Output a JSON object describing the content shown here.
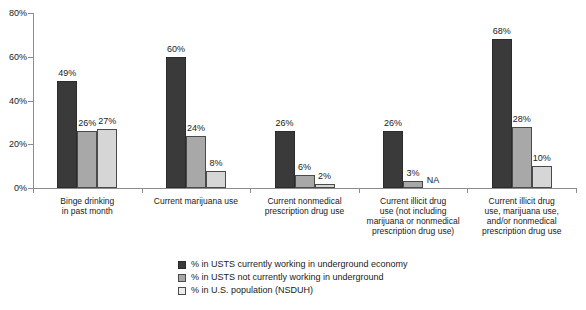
{
  "chart_data": {
    "type": "bar",
    "title": "",
    "xlabel": "",
    "ylabel": "",
    "ylim": [
      0,
      80
    ],
    "ytick_labels": [
      "0%",
      "20%",
      "40%",
      "60%",
      "80%"
    ],
    "ytick_values": [
      0,
      20,
      40,
      60,
      80
    ],
    "grid": false,
    "legend_position": "bottom",
    "categories": [
      "Binge drinking in past month",
      "Current marijuana use",
      "Current nonmedical prescription drug use",
      "Current illicit drug use (not including marijuana or nonmedical prescription drug use)",
      "Current illicit drug use, marijuana use, and/or nonmedical prescription drug use"
    ],
    "category_lines": [
      [
        "Binge drinking",
        "in past month"
      ],
      [
        "Current marijuana use"
      ],
      [
        "Current nonmedical",
        "prescription drug use"
      ],
      [
        "Current illicit drug",
        "use (not including",
        "marijuana or nonmedical",
        "prescription drug use)"
      ],
      [
        "Current illicit drug",
        "use, marijuana use,",
        "and/or nonmedical",
        "prescription drug use"
      ]
    ],
    "series": [
      {
        "name": "% in USTS currently working in underground economy",
        "color": "#3a3a3a",
        "values": [
          49,
          60,
          26,
          26,
          68
        ],
        "labels": [
          "49%",
          "60%",
          "26%",
          "26%",
          "68%"
        ]
      },
      {
        "name": "% in USTS not currently working in underground",
        "color": "#a8a8a8",
        "values": [
          26,
          24,
          6,
          3,
          28
        ],
        "labels": [
          "26%",
          "24%",
          "6%",
          "3%",
          "28%"
        ]
      },
      {
        "name": "% in U.S. population (NSDUH)",
        "color": "#d6d6d6",
        "values": [
          27,
          8,
          2,
          null,
          10
        ],
        "labels": [
          "27%",
          "8%",
          "2%",
          "NA",
          "10%"
        ]
      }
    ]
  }
}
